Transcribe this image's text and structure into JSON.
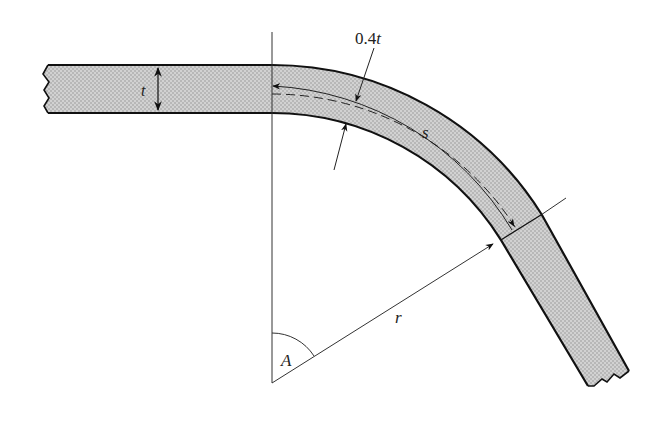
{
  "diagram": {
    "colors": {
      "fill": "#c9c9c9",
      "stroke": "#111111",
      "thin": "#333333",
      "background": "#ffffff"
    },
    "labels": {
      "thickness": "t",
      "neutral_offset_num": "0.4",
      "neutral_offset_var": "t",
      "arc_length": "s",
      "radius": "r",
      "angle": "A"
    },
    "geometry": {
      "center": [
        272,
        383
      ],
      "inner_radius": 270,
      "outer_radius": 318,
      "neutral_radius": 289,
      "thickness_px": 48,
      "bend_angle_deg": 58
    }
  }
}
